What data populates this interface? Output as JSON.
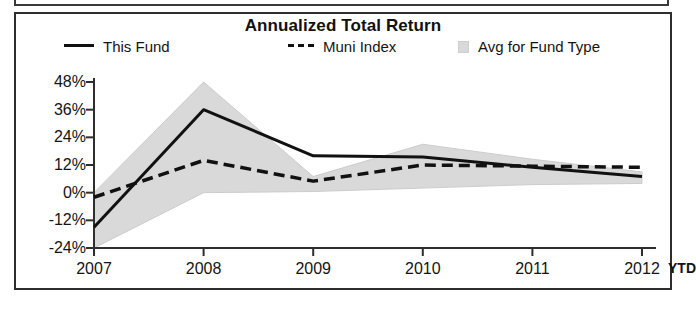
{
  "chart_data": {
    "type": "line",
    "title": "Annualized Total Return",
    "xlabel": "",
    "ylabel": "",
    "categories": [
      "2007",
      "2008",
      "2009",
      "2010",
      "2011",
      "2012"
    ],
    "x_extra_label": "YTD",
    "xtick_labels": [
      "2007",
      "2008",
      "2009",
      "2010",
      "2011",
      "2012"
    ],
    "ytick_labels": [
      "48%",
      "36%",
      "24%",
      "12%",
      "0%",
      "-12%",
      "-24%"
    ],
    "yticks": [
      48,
      36,
      24,
      12,
      0,
      -12,
      -24
    ],
    "ylim": [
      -24,
      48
    ],
    "grid": false,
    "legend_position": "top",
    "series": [
      {
        "name": "This Fund",
        "style": "solid",
        "color": "#111111",
        "values": [
          -15,
          36,
          16,
          15.5,
          11,
          7
        ]
      },
      {
        "name": "Muni Index",
        "style": "dashed",
        "color": "#111111",
        "values": [
          -2,
          14,
          5,
          12,
          11.5,
          11
        ]
      },
      {
        "name": "Avg for Fund Type",
        "style": "band",
        "color": "#d9d9d9",
        "upper": [
          0,
          48,
          7,
          21,
          14.5,
          9
        ],
        "lower": [
          -24,
          0,
          0.5,
          2,
          3.5,
          4
        ]
      }
    ]
  },
  "chart": {
    "title": "Annualized Total Return",
    "legend": [
      {
        "label": "This Fund",
        "key": "solid-line-key"
      },
      {
        "label": "Muni Index",
        "key": "dashed-line-key"
      },
      {
        "label": "Avg for Fund Type",
        "key": "band-swatch-key"
      }
    ],
    "ytd_label": "YTD",
    "colors": {
      "line": "#111111",
      "band": "#d9d9d9",
      "axis": "#2e2e2e",
      "frame": "#2e2e2e"
    }
  }
}
